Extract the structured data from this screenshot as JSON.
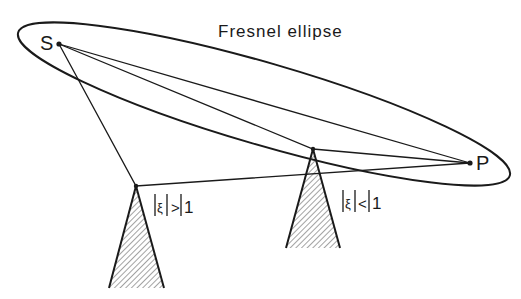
{
  "title": "Fresnel ellipse",
  "points": {
    "source": {
      "label": "S",
      "x": 59,
      "y": 44
    },
    "receiver": {
      "label": "P",
      "x": 470,
      "y": 163
    }
  },
  "obstacles": [
    {
      "name": "left-obstacle",
      "apex": [
        136,
        186
      ],
      "base_left": [
        109,
        288
      ],
      "base_right": [
        164,
        288
      ],
      "label_parts": [
        "|",
        "ξ",
        "|",
        ">",
        "|",
        "1"
      ],
      "label_text": "|ξ| > |1"
    },
    {
      "name": "right-obstacle",
      "apex": [
        313,
        149
      ],
      "base_left": [
        286,
        248
      ],
      "base_right": [
        340,
        248
      ],
      "label_parts": [
        "|",
        "ξ",
        "|",
        "<",
        "|",
        "1"
      ],
      "label_text": "|ξ| < |1"
    }
  ],
  "ellipse": {
    "cx": 264,
    "cy": 104,
    "rx": 256,
    "ry": 41,
    "rotation_deg": 16.2
  },
  "colors": {
    "ink": "#1a1a1a",
    "hatch": "#555555",
    "background": "#ffffff"
  }
}
